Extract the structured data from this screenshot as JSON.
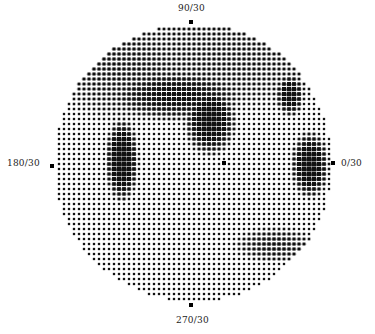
{
  "figure": {
    "type": "visual-field-grayscale-plot",
    "labels": {
      "top": "90/30",
      "left": "180/30",
      "right": "0/30",
      "bottom": "270/30"
    },
    "circle": {
      "cx": 193,
      "cy": 163,
      "r": 139
    },
    "grid": {
      "pitch": 5,
      "dot_base": 2.3,
      "color": "#111111"
    },
    "axis_markers": [
      {
        "x": 191,
        "y": 22
      },
      {
        "x": 52,
        "y": 166
      },
      {
        "x": 333,
        "y": 163
      },
      {
        "x": 191,
        "y": 305
      }
    ],
    "fixation_marker": {
      "x": 224,
      "y": 163
    },
    "dark_regions": [
      {
        "name": "upper-arcuate-band",
        "cx": 175,
        "cy": 95,
        "rx": 60,
        "ry": 22,
        "strength": 0.55
      },
      {
        "name": "superior-left-shadow",
        "cx": 130,
        "cy": 70,
        "rx": 70,
        "ry": 45,
        "strength": 0.3
      },
      {
        "name": "left-vertical-scotoma",
        "cx": 122,
        "cy": 160,
        "rx": 14,
        "ry": 35,
        "strength": 0.85
      },
      {
        "name": "central-upper-scotoma",
        "cx": 210,
        "cy": 120,
        "rx": 22,
        "ry": 30,
        "strength": 0.75
      },
      {
        "name": "upper-right-scotoma",
        "cx": 290,
        "cy": 95,
        "rx": 12,
        "ry": 18,
        "strength": 0.7
      },
      {
        "name": "right-nasal-scotoma",
        "cx": 310,
        "cy": 165,
        "rx": 16,
        "ry": 28,
        "strength": 0.8
      },
      {
        "name": "lower-right-band",
        "cx": 275,
        "cy": 245,
        "rx": 35,
        "ry": 15,
        "strength": 0.35
      },
      {
        "name": "upper-field-general",
        "cx": 220,
        "cy": 60,
        "rx": 110,
        "ry": 45,
        "strength": 0.25
      }
    ]
  }
}
